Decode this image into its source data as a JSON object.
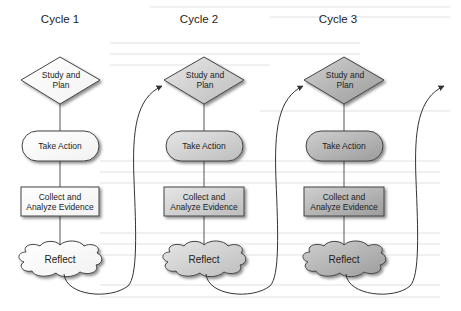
{
  "diagram": {
    "cycles": [
      {
        "heading": "Cycle 1",
        "steps": {
          "study": "Study and\nPlan",
          "study_line1": "Study and",
          "study_line2": "Plan",
          "action": "Take Action",
          "collect_line1": "Collect and",
          "collect_line2": "Analyze Evidence",
          "reflect": "Reflect"
        }
      },
      {
        "heading": "Cycle 2",
        "steps": {
          "study_line1": "Study and",
          "study_line2": "Plan",
          "action": "Take Action",
          "collect_line1": "Collect and",
          "collect_line2": "Analyze Evidence",
          "reflect": "Reflect"
        }
      },
      {
        "heading": "Cycle 3",
        "steps": {
          "study_line1": "Study and",
          "study_line2": "Plan",
          "action": "Take Action",
          "collect_line1": "Collect and",
          "collect_line2": "Analyze Evidence",
          "reflect": "Reflect"
        }
      }
    ],
    "shapes": {
      "study": "diamond",
      "action": "rounded-pill",
      "collect": "rectangle",
      "reflect": "cloud"
    },
    "connectors": [
      {
        "from": "Cycle 1 Reflect",
        "to": "Cycle 2 Study and Plan",
        "type": "curved-arrow"
      },
      {
        "from": "Cycle 2 Reflect",
        "to": "Cycle 3 Study and Plan",
        "type": "curved-arrow"
      },
      {
        "from": "Cycle 3 Reflect",
        "to": "next cycle (off page)",
        "type": "curved-arrow"
      }
    ],
    "colors": {
      "cycle1_fill": "#fdfdfd",
      "cycle2_fill": "#d2d2d2",
      "cycle3_fill": "#b4b4b4",
      "stroke": "#444444",
      "text": "#222222"
    }
  }
}
